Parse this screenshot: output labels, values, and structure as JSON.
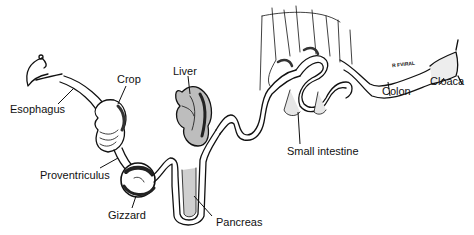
{
  "diagram": {
    "colors": {
      "ink": "#111111",
      "background": "#ffffff",
      "shade": "#555555",
      "stipple": "#9a9a9a"
    },
    "labels": [
      {
        "id": "esophagus",
        "text": "Esophagus"
      },
      {
        "id": "crop",
        "text": "Crop"
      },
      {
        "id": "liver",
        "text": "Liver"
      },
      {
        "id": "proventriculus",
        "text": "Proventriculus"
      },
      {
        "id": "gizzard",
        "text": "Gizzard"
      },
      {
        "id": "pancreas",
        "text": "Pancreas"
      },
      {
        "id": "small_intestine",
        "text": "Small intestine"
      },
      {
        "id": "colon",
        "text": "Colon"
      },
      {
        "id": "cloaca",
        "text": "Cloaca"
      }
    ],
    "annotation": {
      "text": "R FVIRAL"
    }
  }
}
